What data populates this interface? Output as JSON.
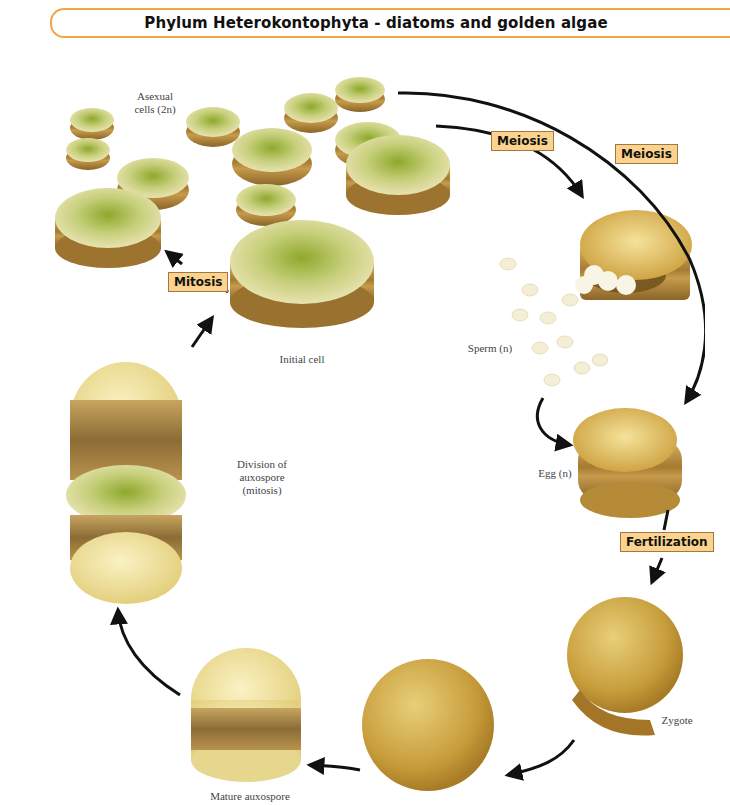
{
  "title": "Phylum Heterokontophyta - diatoms and golden algae",
  "colors": {
    "title_border": "#f0a845",
    "stage_box_fill": "#fbd38e",
    "stage_box_border": "#a07840",
    "diatom_gold": "#c9a24a",
    "diatom_dark": "#8f6a2a",
    "diatom_green": "#9fb23c",
    "auxospore_light": "#f2e6a6"
  },
  "stages": {
    "meiosis_1": "Meiosis",
    "meiosis_2": "Meiosis",
    "mitosis": "Mitosis",
    "fertilization": "Fertilization"
  },
  "labels": {
    "asexual_line1": "Asexual",
    "asexual_line2": "cells (2n)",
    "initial_cell": "Initial cell",
    "sperm": "Sperm (n)",
    "egg": "Egg (n)",
    "division_line1": "Division of",
    "division_line2": "auxospore",
    "division_line3": "(mitosis)",
    "zygote": "Zygote",
    "mature_auxospore": "Mature auxospore"
  },
  "cycle_order": [
    "Asexual cells (2n)",
    "Meiosis",
    "Sperm (n)",
    "Egg (n)",
    "Fertilization",
    "Zygote",
    "Young auxospore",
    "Mature auxospore",
    "Division of auxospore (mitosis)",
    "Initial cell",
    "Mitosis"
  ]
}
